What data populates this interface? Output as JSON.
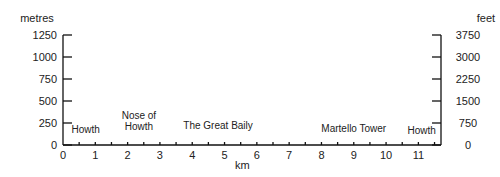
{
  "chart_data": {
    "type": "line",
    "title": "",
    "xlabel": "km",
    "ylabel_left": "metres",
    "ylabel_right": "feet",
    "xlim": [
      0,
      11.7
    ],
    "ylim_left": [
      0,
      1250
    ],
    "ylim_right": [
      0,
      3750
    ],
    "x_ticks": [
      0,
      1,
      2,
      3,
      4,
      5,
      6,
      7,
      8,
      9,
      10,
      11
    ],
    "x_minor_ticks_step": 0.5,
    "y_left_ticks": [
      0,
      250,
      500,
      750,
      1000,
      1250
    ],
    "y_right_ticks": [
      0,
      750,
      1500,
      2250,
      3000,
      3750
    ],
    "grid": false,
    "series": [],
    "annotations": [
      {
        "text": "Howth",
        "x": 0.7,
        "y_label_px": 133
      },
      {
        "text": "Nose of\nHowth",
        "lines": [
          "Nose of",
          "Howth"
        ],
        "x": 2.35,
        "y_label_px": 119
      },
      {
        "text": "The Great Baily",
        "x": 4.8,
        "y_label_px": 129
      },
      {
        "text": "Martello Tower",
        "x": 9.0,
        "y_label_px": 132
      },
      {
        "text": "Howth",
        "x": 11.1,
        "y_label_px": 134
      }
    ]
  }
}
